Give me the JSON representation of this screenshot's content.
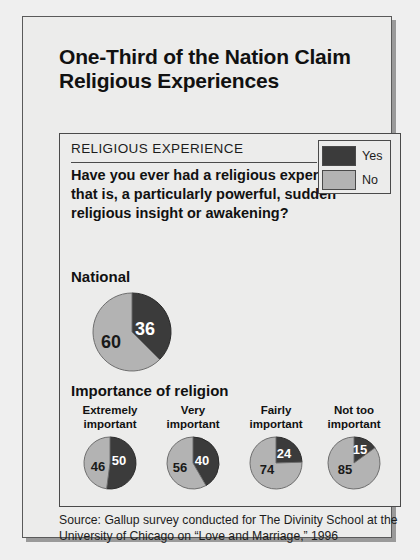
{
  "title": "One-Third of the Nation Claim Religious Experiences",
  "panel": {
    "heading": "RELIGIOUS EXPERIENCE",
    "question": "Have you ever had a religious experience—that is, a particularly powerful, sudden religious insight or awakening?",
    "national_label": "National",
    "importance_label": "Importance of religion"
  },
  "legend": {
    "items": [
      {
        "label": "Yes",
        "color": "#3b3b3b"
      },
      {
        "label": "No",
        "color": "#b3b3b3"
      }
    ]
  },
  "source": "Source: Gallup survey conducted for The Divinity School at the University of Chicago on “Love and Marriage,” 1996",
  "chart_data": {
    "type": "pie",
    "title": "One-Third of the Nation Claim Religious Experiences",
    "question": "Have you ever had a religious experience—that is, a particularly powerful, sudden religious insight or awakening?",
    "legend_position": "top-right",
    "legend": [
      "Yes",
      "No"
    ],
    "colors": {
      "Yes": "#3b3b3b",
      "No": "#b3b3b3"
    },
    "units": "percent",
    "pies": [
      {
        "group": "national",
        "label": "National",
        "values": {
          "Yes": 36,
          "No": 60
        },
        "labels": [
          "36",
          "60"
        ]
      },
      {
        "group": "importance_of_religion",
        "label": "Extremely important",
        "label_line1": "Extremely",
        "label_line2": "important",
        "values": {
          "Yes": 50,
          "No": 46
        },
        "labels": [
          "50",
          "46"
        ]
      },
      {
        "group": "importance_of_religion",
        "label": "Very important",
        "label_line1": "Very",
        "label_line2": "important",
        "values": {
          "Yes": 40,
          "No": 56
        },
        "labels": [
          "40",
          "56"
        ]
      },
      {
        "group": "importance_of_religion",
        "label": "Fairly important",
        "label_line1": "Fairly",
        "label_line2": "important",
        "values": {
          "Yes": 24,
          "No": 74
        },
        "labels": [
          "24",
          "74"
        ]
      },
      {
        "group": "importance_of_religion",
        "label": "Not too important",
        "label_line1": "Not too",
        "label_line2": "important",
        "values": {
          "Yes": 15,
          "No": 85
        },
        "labels": [
          "15",
          "85"
        ]
      }
    ],
    "source": "Source: Gallup survey conducted for The Divinity School at the University of Chicago on “Love and Marriage,” 1996"
  }
}
